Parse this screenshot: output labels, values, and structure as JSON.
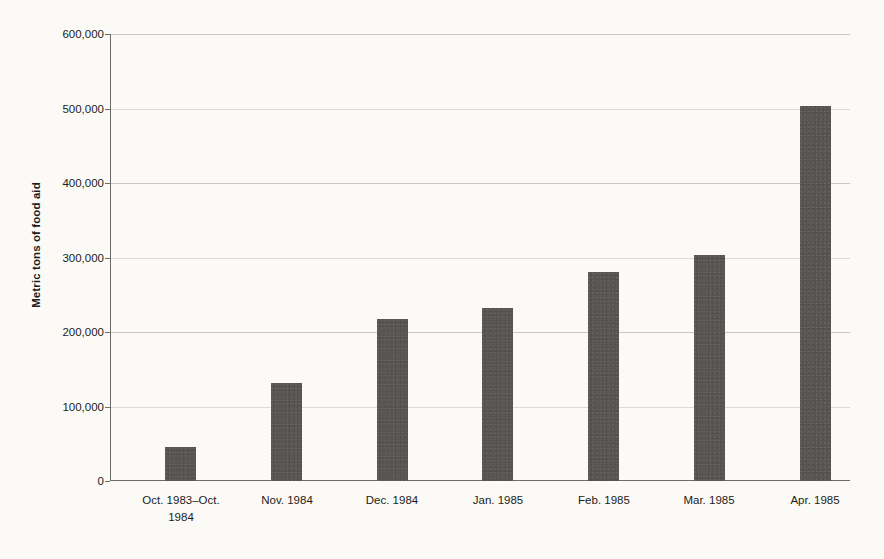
{
  "chart_data": {
    "type": "bar",
    "title": "",
    "subtitle": "",
    "xlabel": "",
    "ylabel": "Metric tons of food aid",
    "categories": [
      "Oct. 1983–Oct. 1984",
      "Nov. 1984",
      "Dec. 1984",
      "Jan. 1985",
      "Feb. 1985",
      "Mar. 1985",
      "Apr. 1985"
    ],
    "values": [
      45000,
      131000,
      218000,
      232000,
      280000,
      303000,
      503000
    ],
    "ylim": [
      0,
      600000
    ],
    "ytick_values": [
      0,
      100000,
      200000,
      300000,
      400000,
      500000,
      600000
    ],
    "ytick_labels": [
      "0",
      "100,000",
      "200,000",
      "300,000",
      "400,000",
      "500,000",
      "600,000"
    ],
    "grid": true,
    "grid_axis": "y",
    "legend": false,
    "legend_position": "none",
    "bar_color": "#565452",
    "background_color": "#fbfaf7",
    "gridline_color": "#c9c7c1",
    "axis_color": "#6e6c68",
    "text_color": "#1d1c1a"
  }
}
